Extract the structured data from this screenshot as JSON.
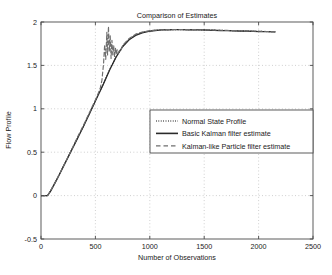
{
  "chart_data": {
    "type": "line",
    "title": "Comparison of Estimates",
    "xlabel": "Number of Observations",
    "ylabel": "Flow Profile",
    "xlim": [
      0,
      2500
    ],
    "ylim": [
      -0.5,
      2
    ],
    "xticks": [
      0,
      500,
      1000,
      1500,
      2000,
      2500
    ],
    "xticklabels": [
      "0",
      "500",
      "1000",
      "1500",
      "2000",
      "2500"
    ],
    "yticks": [
      -0.5,
      0,
      0.5,
      1,
      1.5,
      2
    ],
    "yticklabels": [
      "-0.5",
      "0",
      "0.5",
      "1",
      "1.5",
      "2"
    ],
    "grid": true,
    "grid_style": "dotted",
    "legend_position": "center-right",
    "legend": [
      {
        "label": "Normal State Profile",
        "style": "dotted",
        "color": "#3c3c3c"
      },
      {
        "label": "Basic Kalman filter estimate",
        "style": "solid",
        "color": "#2a2a2a"
      },
      {
        "label": "Kalman-like Particle filter estimate",
        "style": "dashed",
        "color": "#6e6e6e"
      }
    ],
    "series": [
      {
        "name": "Normal State Profile",
        "style": "dotted",
        "color": "#3c3c3c",
        "x": [
          0,
          30,
          60,
          90,
          150,
          210,
          270,
          330,
          390,
          450,
          510,
          570,
          630,
          690,
          750,
          810,
          870,
          930,
          990,
          1050,
          1110,
          1170,
          1230,
          1290,
          1350,
          1410,
          1470,
          1530,
          1590,
          1650,
          1710,
          1770,
          1830,
          1890,
          1950,
          2010,
          2070,
          2130,
          2150
        ],
        "y": [
          0,
          0,
          0,
          0.06,
          0.2,
          0.35,
          0.5,
          0.65,
          0.8,
          0.96,
          1.12,
          1.28,
          1.45,
          1.6,
          1.72,
          1.8,
          1.85,
          1.88,
          1.895,
          1.905,
          1.91,
          1.912,
          1.913,
          1.913,
          1.912,
          1.911,
          1.91,
          1.908,
          1.906,
          1.904,
          1.902,
          1.9,
          1.898,
          1.896,
          1.894,
          1.892,
          1.89,
          1.889,
          1.888
        ]
      },
      {
        "name": "Basic Kalman filter estimate",
        "style": "solid",
        "color": "#2a2a2a",
        "x": [
          0,
          30,
          60,
          90,
          150,
          210,
          270,
          330,
          390,
          450,
          510,
          570,
          630,
          690,
          750,
          810,
          870,
          930,
          990,
          1050,
          1110,
          1170,
          1230,
          1290,
          1350,
          1410,
          1470,
          1530,
          1590,
          1650,
          1710,
          1770,
          1830,
          1890,
          1950,
          2010,
          2070,
          2130,
          2150
        ],
        "y": [
          0,
          0,
          0,
          0.055,
          0.195,
          0.345,
          0.495,
          0.645,
          0.795,
          0.955,
          1.115,
          1.275,
          1.445,
          1.595,
          1.715,
          1.795,
          1.845,
          1.875,
          1.892,
          1.902,
          1.908,
          1.91,
          1.911,
          1.911,
          1.91,
          1.909,
          1.908,
          1.906,
          1.904,
          1.902,
          1.9,
          1.898,
          1.896,
          1.894,
          1.892,
          1.89,
          1.888,
          1.887,
          1.886
        ]
      },
      {
        "name": "Kalman-like Particle filter estimate",
        "style": "dashed",
        "color": "#6e6e6e",
        "comment": "tracks the profile but bursts into noise between x=560 and x=730",
        "x": [
          0,
          30,
          60,
          90,
          150,
          210,
          270,
          330,
          390,
          450,
          510,
          545,
          560,
          575,
          585,
          595,
          605,
          612,
          620,
          628,
          636,
          644,
          652,
          660,
          668,
          676,
          684,
          692,
          700,
          710,
          720,
          730,
          750,
          810,
          870,
          930,
          990,
          1050,
          1110,
          1170,
          1230,
          1290,
          1350,
          1410,
          1470,
          1530,
          1590,
          1650,
          1710,
          1770,
          1830,
          1890,
          1950,
          2010,
          2070,
          2130,
          2150
        ],
        "y": [
          0,
          0,
          0,
          0.06,
          0.2,
          0.35,
          0.5,
          0.66,
          0.81,
          0.97,
          1.13,
          1.24,
          1.33,
          1.52,
          1.74,
          1.57,
          1.88,
          1.62,
          1.95,
          1.66,
          1.84,
          1.58,
          1.79,
          1.62,
          1.73,
          1.6,
          1.7,
          1.63,
          1.68,
          1.64,
          1.67,
          1.66,
          1.73,
          1.81,
          1.86,
          1.884,
          1.898,
          1.906,
          1.911,
          1.913,
          1.914,
          1.914,
          1.913,
          1.912,
          1.911,
          1.909,
          1.907,
          1.905,
          1.903,
          1.901,
          1.899,
          1.897,
          1.895,
          1.893,
          1.891,
          1.89,
          1.889
        ]
      }
    ]
  },
  "colors": {
    "axis": "#4a4a4a",
    "grid": "#b4b4b4",
    "text": "#1a1a1a",
    "background": "#ffffff"
  }
}
